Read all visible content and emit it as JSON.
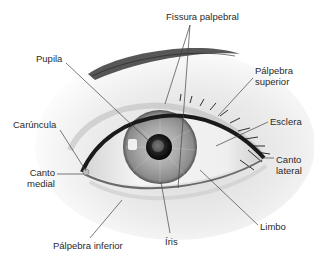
{
  "diagram": {
    "colors": {
      "background": "#ffffff",
      "text": "#2a2a2a",
      "leader_line": "#444444",
      "iris": "#9a9a9a",
      "pupil": "#111111",
      "sclera": "#f2f2f2",
      "lashes": "#1a1a1a"
    },
    "labels": {
      "fissura_palpebral": "Fissura palpebral",
      "pupila": "Pupila",
      "palpebra_superior_line1": "Pálpebra",
      "palpebra_superior_line2": "superior",
      "esclera": "Esclera",
      "caruncula": "Carúncula",
      "canto_medial_line1": "Canto",
      "canto_medial_line2": "medial",
      "canto_lateral_line1": "Canto",
      "canto_lateral_line2": "lateral",
      "limbo": "Limbo",
      "iris": "Íris",
      "palpebra_inferior": "Pálpebra inferior"
    }
  }
}
